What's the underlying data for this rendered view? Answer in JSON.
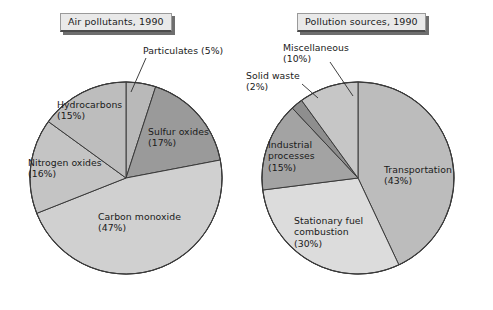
{
  "figure": {
    "background": "#ffffff",
    "slice_border_color": "#3a3a3a"
  },
  "charts": [
    {
      "id": "air-pollutants",
      "title": "Air pollutants, 1990",
      "center": {
        "x": 126,
        "y": 178
      },
      "radius": 97
    },
    {
      "id": "pollution-sources",
      "title": "Pollution sources, 1990",
      "center": {
        "x": 358,
        "y": 178
      },
      "radius": 97
    }
  ],
  "labels": {
    "particulates": "Particulates (5%)",
    "sulfur_oxides": "Sulfur oxides\n(17%)",
    "carbon_monoxide": "Carbon monoxide\n(47%)",
    "nitrogen_oxides": "Nitrogen oxides\n(16%)",
    "hydrocarbons": "Hydrocarbons\n(15%)",
    "transportation": "Transportation\n(43%)",
    "stationary": "Stationary fuel\ncombustion\n(30%)",
    "industrial": "Industrial\nprocesses\n(15%)",
    "solid_waste": "Solid waste\n(2%)",
    "miscellaneous": "Miscellaneous\n(10%)"
  },
  "chart_data": [
    {
      "type": "pie",
      "title": "Air pollutants, 1990",
      "xlabel": "",
      "ylabel": "",
      "start_angle_deg": 0,
      "direction": "clockwise",
      "units": "percent",
      "categories": [
        "Particulates",
        "Sulfur oxides",
        "Carbon monoxide",
        "Nitrogen oxides",
        "Hydrocarbons"
      ],
      "values": [
        5,
        17,
        47,
        16,
        15
      ],
      "colors": [
        "#b9b9b9",
        "#9a9a9a",
        "#d0d0d0",
        "#c4c4c4",
        "#bdbdbd"
      ],
      "data_labels": [
        "Particulates (5%)",
        "Sulfur oxides (17%)",
        "Carbon monoxide (47%)",
        "Nitrogen oxides (16%)",
        "Hydrocarbons (15%)"
      ],
      "legend": "none",
      "grid": false
    },
    {
      "type": "pie",
      "title": "Pollution sources, 1990",
      "xlabel": "",
      "ylabel": "",
      "start_angle_deg": 0,
      "direction": "clockwise",
      "units": "percent",
      "categories": [
        "Transportation",
        "Stationary fuel combustion",
        "Industrial processes",
        "Solid waste",
        "Miscellaneous"
      ],
      "values": [
        43,
        30,
        15,
        2,
        10
      ],
      "colors": [
        "#bcbcbc",
        "#dcdcdc",
        "#a3a3a3",
        "#8e8e8e",
        "#c6c6c6"
      ],
      "data_labels": [
        "Transportation (43%)",
        "Stationary fuel combustion (30%)",
        "Industrial processes (15%)",
        "Solid waste (2%)",
        "Miscellaneous (10%)"
      ],
      "legend": "none",
      "grid": false
    }
  ]
}
